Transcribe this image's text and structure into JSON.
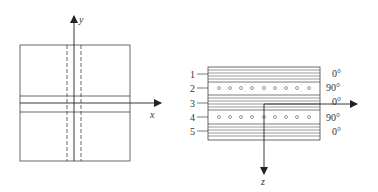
{
  "left_figure": {
    "x_axis_label": "x",
    "y_axis_label": "y"
  },
  "right_figure": {
    "z_axis_label": "z",
    "layers": [
      {
        "number": "1",
        "angle": "0°"
      },
      {
        "number": "2",
        "angle": "90°"
      },
      {
        "number": "3",
        "angle": "0°"
      },
      {
        "number": "4",
        "angle": "90°"
      },
      {
        "number": "5",
        "angle": "0°"
      }
    ]
  }
}
